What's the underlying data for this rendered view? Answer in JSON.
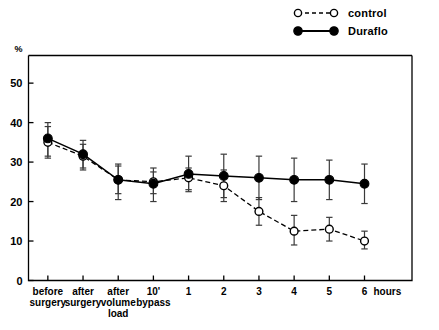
{
  "legend": {
    "items": [
      {
        "label": "control",
        "marker": "open-circle",
        "line": "dashed",
        "color": "#000000"
      },
      {
        "label": "Duraflo",
        "marker": "filled-circle",
        "line": "solid",
        "color": "#000000"
      }
    ]
  },
  "chart_data": {
    "type": "line",
    "title": "",
    "subtitle": "",
    "xlabel": "",
    "ylabel": "%",
    "ylim": [
      0,
      57
    ],
    "yticks": [
      0,
      10,
      20,
      30,
      40,
      50
    ],
    "ytick_labels": [
      "0",
      "10",
      "20",
      "30",
      "40",
      "50"
    ],
    "grid": false,
    "legend_position": "top-right",
    "x_unit_label": "hours",
    "categories": [
      "before surgery",
      "after surgery",
      "after volume load",
      "10' bypass",
      "1",
      "2",
      "3",
      "4",
      "5",
      "6"
    ],
    "xtick_labels": [
      "before\nsurgery",
      "after\nsurgery",
      "after\nvolume\nload",
      "10'\nbypass",
      "1",
      "2",
      "3",
      "4",
      "5",
      "6"
    ],
    "series": [
      {
        "name": "Duraflo",
        "marker": "filled-circle",
        "line": "solid",
        "values": [
          36,
          32,
          25.5,
          24.5,
          27,
          26.5,
          26,
          25.5,
          25.5,
          24.5
        ],
        "errors_upper": [
          40,
          35.5,
          29.5,
          28.5,
          31.5,
          32,
          31.5,
          31,
          30.5,
          29.5
        ],
        "errors_lower": [
          31,
          28,
          20.5,
          20,
          22.5,
          21,
          20.5,
          20,
          20.5,
          19.5
        ]
      },
      {
        "name": "control",
        "marker": "open-circle",
        "line": "dashed",
        "values": [
          35,
          31.5,
          25.5,
          25,
          26,
          24,
          17.5,
          12.5,
          13,
          10
        ],
        "errors_upper": [
          39,
          34.5,
          29,
          27.5,
          28.5,
          28,
          21,
          16.5,
          16,
          12.5
        ],
        "errors_lower": [
          31.5,
          28.5,
          22,
          22,
          23,
          20,
          14,
          9,
          10,
          8
        ]
      }
    ]
  }
}
